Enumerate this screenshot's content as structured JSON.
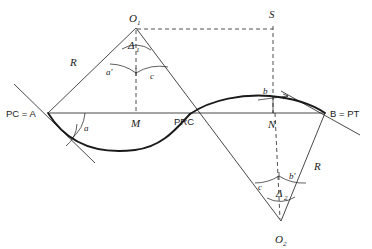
{
  "figure": {
    "background_color": "#ffffff",
    "line_color": "#1a1a1a",
    "dashed_color": "#3a3a3a"
  },
  "points": {
    "pc_a": "PC = A",
    "b_pt": "B = PT",
    "prc": "PRC",
    "m": "M",
    "n": "N",
    "s": "S",
    "o1": "O",
    "o1_sub": "1",
    "o2": "O",
    "o2_sub": "2"
  },
  "radii": {
    "r_left": "R",
    "r_right": "R"
  },
  "angles": {
    "delta1": "Δ",
    "delta1_sub": "1",
    "delta2": "Δ",
    "delta2_sub": "2",
    "a": "a",
    "a_prime": "a'",
    "b": "b",
    "b_prime": "b'",
    "c_top": "c",
    "c_bottom": "c"
  },
  "geometry": {
    "baseline_y": 113,
    "point_a_x": 48,
    "point_b_x": 325,
    "prc_x": 190,
    "m_x": 136,
    "n_x": 273,
    "o1_x": 136,
    "o1_y": 28,
    "o2_x": 281,
    "o2_y": 221,
    "s_x": 273,
    "s_y": 24,
    "arc1_low_y": 150,
    "arc2_high_y": 96
  }
}
